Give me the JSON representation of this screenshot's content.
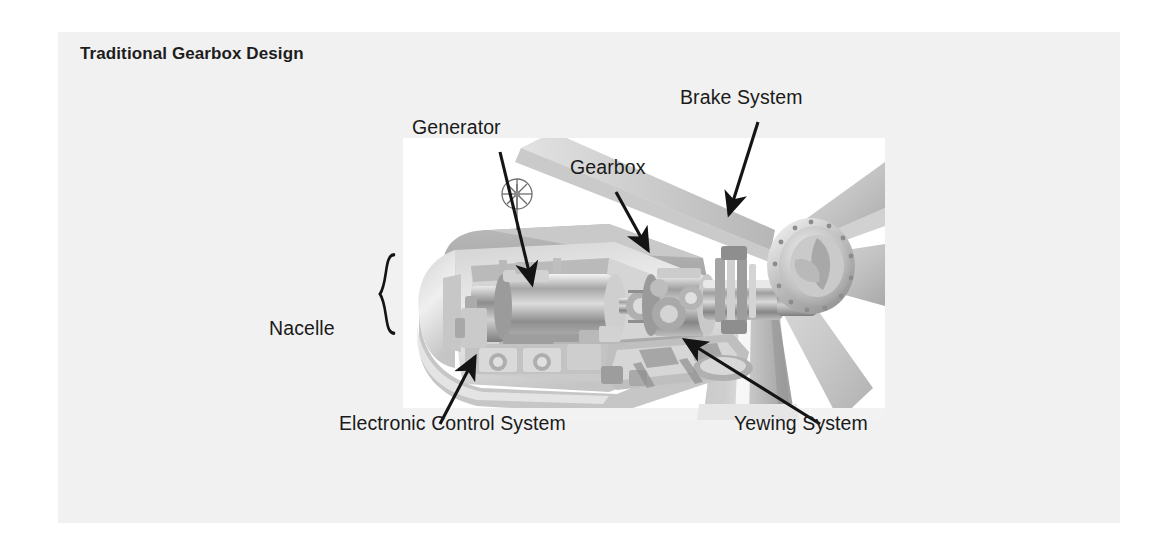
{
  "card": {
    "title": "Traditional Gearbox Design",
    "background_color": "#f1f1f1",
    "text_color": "#1d1d1d"
  },
  "figure": {
    "type": "cutaway-photo-diagram",
    "photo_background": "#ffffff",
    "line_color": "#141414"
  },
  "labels": {
    "generator": "Generator",
    "gearbox": "Gearbox",
    "brake_system": "Brake System",
    "nacelle": "Nacelle",
    "electronic_control_system": "Electronic Control System",
    "yewing_system": "Yewing System"
  },
  "callouts": [
    {
      "label": "Generator",
      "marker": "arrow",
      "from": [
        500,
        152
      ],
      "to": [
        534,
        290
      ]
    },
    {
      "label": "Gearbox",
      "marker": "arrow",
      "from": [
        616,
        192
      ],
      "to": [
        649,
        256
      ]
    },
    {
      "label": "Brake System",
      "marker": "arrow",
      "from": [
        758,
        122
      ],
      "to": [
        728,
        219
      ]
    },
    {
      "label": "Nacelle",
      "marker": "curly-brace",
      "from": [
        389,
        225
      ],
      "to": [
        389,
        381
      ]
    },
    {
      "label": "Electronic Control System",
      "marker": "arrow",
      "from": [
        440,
        424
      ],
      "to": [
        476,
        354
      ]
    },
    {
      "label": "Yewing System",
      "marker": "arrow",
      "from": [
        820,
        424
      ],
      "to": [
        681,
        338
      ]
    }
  ]
}
